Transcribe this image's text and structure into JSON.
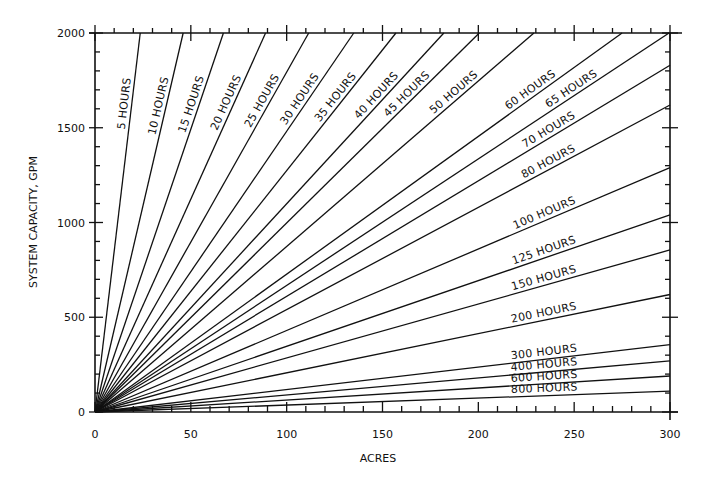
{
  "chart_data": {
    "type": "line",
    "title": "",
    "xlabel": "ACRES",
    "ylabel": "SYSTEM CAPACITY, GPM",
    "xlim": [
      0,
      300
    ],
    "ylim": [
      0,
      2000
    ],
    "x_ticks": [
      0,
      50,
      100,
      150,
      200,
      250,
      300
    ],
    "y_ticks": [
      0,
      500,
      1000,
      1500,
      2000
    ],
    "x_tick_labels": [
      "0",
      "50",
      "100",
      "150",
      "200",
      "250",
      "300"
    ],
    "y_tick_labels": [
      "0",
      "500",
      "1000",
      "1500",
      "2000"
    ],
    "x_minor_step": 10,
    "y_minor_step": 100,
    "grid": false,
    "series": [
      {
        "name": "5 HOURS",
        "label": "5 HOURS",
        "end": {
          "x": 23.6,
          "y": 2000
        }
      },
      {
        "name": "10 HOURS",
        "label": "10 HOURS",
        "end": {
          "x": 46,
          "y": 2000
        }
      },
      {
        "name": "15 HOURS",
        "label": "15 HOURS",
        "end": {
          "x": 67,
          "y": 2000
        }
      },
      {
        "name": "20 HOURS",
        "label": "20 HOURS",
        "end": {
          "x": 89,
          "y": 2000
        }
      },
      {
        "name": "25 HOURS",
        "label": "25 HOURS",
        "end": {
          "x": 111.5,
          "y": 2000
        }
      },
      {
        "name": "30 HOURS",
        "label": "30 HOURS",
        "end": {
          "x": 135,
          "y": 2000
        }
      },
      {
        "name": "35 HOURS",
        "label": "35 HOURS",
        "end": {
          "x": 157,
          "y": 2000
        }
      },
      {
        "name": "40 HOURS",
        "label": "40 HOURS",
        "end": {
          "x": 182,
          "y": 2000
        }
      },
      {
        "name": "45 HOURS",
        "label": "45 HOURS",
        "end": {
          "x": 200.5,
          "y": 2000
        }
      },
      {
        "name": "50 HOURS",
        "label": "50 HOURS",
        "end": {
          "x": 229,
          "y": 2000
        }
      },
      {
        "name": "60 HOURS",
        "label": "60 HOURS",
        "end": {
          "x": 275,
          "y": 2000
        }
      },
      {
        "name": "65 HOURS",
        "label": "65 HOURS",
        "end": {
          "x": 299.5,
          "y": 2000
        }
      },
      {
        "name": "70 HOURS",
        "label": "70 HOURS",
        "end": {
          "x": 300,
          "y": 1830
        }
      },
      {
        "name": "80 HOURS",
        "label": "80 HOURS",
        "end": {
          "x": 300,
          "y": 1620
        }
      },
      {
        "name": "100 HOURS",
        "label": "100 HOURS",
        "end": {
          "x": 300,
          "y": 1290
        }
      },
      {
        "name": "125 HOURS",
        "label": "125 HOURS",
        "end": {
          "x": 300,
          "y": 1040
        }
      },
      {
        "name": "150 HOURS",
        "label": "150 HOURS",
        "end": {
          "x": 300,
          "y": 855
        }
      },
      {
        "name": "200 HOURS",
        "label": "200 HOURS",
        "end": {
          "x": 300,
          "y": 620
        }
      },
      {
        "name": "300 HOURS",
        "label": "300 HOURS",
        "end": {
          "x": 300,
          "y": 355
        }
      },
      {
        "name": "400 HOURS",
        "label": "400 HOURS",
        "end": {
          "x": 300,
          "y": 270
        }
      },
      {
        "name": "600 HOURS",
        "label": "600 HOURS",
        "end": {
          "x": 300,
          "y": 190
        }
      },
      {
        "name": "800 HOURS",
        "label": "800 HOURS",
        "end": {
          "x": 300,
          "y": 110
        }
      }
    ]
  }
}
